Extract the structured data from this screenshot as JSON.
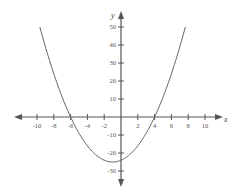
{
  "chart_data": {
    "type": "line",
    "title": "",
    "xlabel": "x",
    "ylabel": "y",
    "function": "y = x^2 + 2x - 24",
    "xlim": [
      -12,
      12
    ],
    "ylim": [
      -35,
      55
    ],
    "grid": false,
    "legend": null,
    "x_ticks": [
      -10,
      -8,
      -6,
      -4,
      -2,
      2,
      4,
      6,
      8,
      10
    ],
    "x_tick_labels": [
      "-10",
      "-8",
      "-6",
      "-4",
      "-2",
      "2",
      "4",
      "6",
      "8",
      "10"
    ],
    "y_ticks": [
      50,
      40,
      30,
      20,
      10,
      -10,
      -20,
      -30
    ],
    "y_tick_labels": [
      "50",
      "40",
      "30",
      "20",
      "10",
      "-10",
      "-20",
      "-30"
    ],
    "series": [
      {
        "name": "parabola",
        "x": [
          -9.66,
          -9,
          -8,
          -7,
          -6,
          -5,
          -4,
          -3,
          -2,
          -1,
          0,
          1,
          2,
          3,
          4,
          5,
          6,
          7,
          7.66
        ],
        "y": [
          50,
          39,
          24,
          11,
          0,
          -9,
          -16,
          -21,
          -24,
          -25,
          -24,
          -21,
          -16,
          -9,
          0,
          11,
          24,
          39,
          50
        ]
      }
    ],
    "annotations": {
      "x_intercepts": [
        -6,
        4
      ],
      "y_intercept": -24,
      "vertex": [
        -1,
        -25
      ]
    },
    "colors": {
      "axis": "#555555",
      "curve": "#666666"
    }
  }
}
